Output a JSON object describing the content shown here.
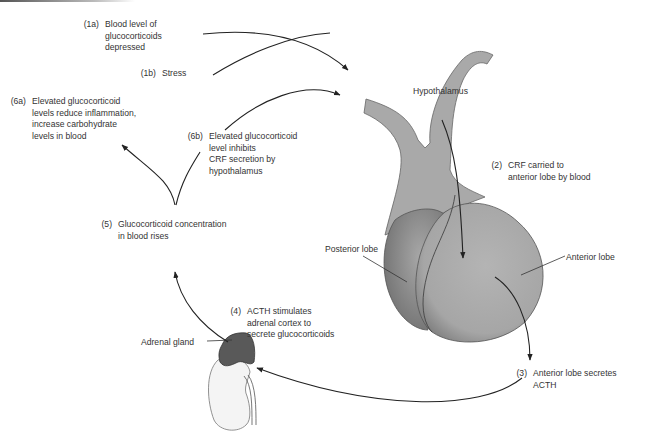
{
  "diagram": {
    "type": "feedback-loop",
    "colors": {
      "gland_fill": "#a9a9a9",
      "gland_edge": "#555555",
      "adrenal_fill": "#585858",
      "kidney_fill": "#f3f3f3",
      "line": "#222222",
      "text": "#333333"
    },
    "structures": {
      "hypothalamus": "Hypothalamus",
      "posterior_lobe": "Posterior lobe",
      "anterior_lobe": "Anterior lobe",
      "adrenal_gland": "Adrenal gland"
    },
    "steps": [
      {
        "id": "1a",
        "num": "(1a)",
        "lines": [
          "Blood level of",
          "glucocorticoids",
          "depressed"
        ]
      },
      {
        "id": "1b",
        "num": "(1b)",
        "lines": [
          "Stress"
        ]
      },
      {
        "id": "2",
        "num": "(2)",
        "lines": [
          "CRF carried to",
          "anterior lobe by blood"
        ]
      },
      {
        "id": "3",
        "num": "(3)",
        "lines": [
          "Anterior lobe secretes",
          "ACTH"
        ]
      },
      {
        "id": "4",
        "num": "(4)",
        "lines": [
          "ACTH stimulates",
          "adrenal cortex to",
          "secrete glucocorticoids"
        ]
      },
      {
        "id": "5",
        "num": "(5)",
        "lines": [
          "Glucocorticoid concentration",
          "in blood rises"
        ]
      },
      {
        "id": "6a",
        "num": "(6a)",
        "lines": [
          "Elevated glucocorticoid",
          "levels reduce inflammation,",
          "increase carbohydrate",
          "levels in blood"
        ]
      },
      {
        "id": "6b",
        "num": "(6b)",
        "lines": [
          "Elevated glucocorticoid",
          "level inhibits",
          "CRF secretion by",
          "hypothalamus"
        ]
      }
    ]
  }
}
